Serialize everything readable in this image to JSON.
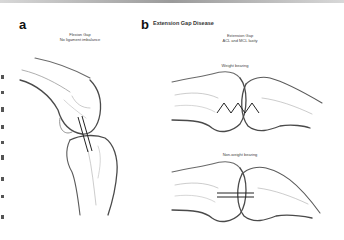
{
  "panel_a": {
    "letter": "a",
    "caption_line1": "Flexion Gap",
    "caption_line2": "No ligament imbalance"
  },
  "panel_b": {
    "letter": "b",
    "title": "Extension Gap Disease",
    "caption_line1": "Extension Gap",
    "caption_line2": "ACL and MCL laxity",
    "upper_label": "Weight bearing",
    "lower_label": "Non-weight bearing"
  },
  "colors": {
    "outline": "#4a4a4a",
    "sketch": "#9a9a9a",
    "marker": "#222222"
  }
}
